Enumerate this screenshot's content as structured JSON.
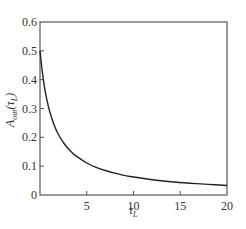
{
  "chart_data": {
    "type": "line",
    "title": "",
    "xlabel": "τ_L",
    "ylabel": "A_out(τ_L)",
    "xlim": [
      0,
      20
    ],
    "ylim": [
      0,
      0.6
    ],
    "grid": false,
    "legend": null,
    "xticks": [
      0,
      5,
      10,
      15,
      20
    ],
    "xtick_labels": [
      "",
      "5",
      "10",
      "15",
      "20"
    ],
    "yticks": [
      0,
      0.1,
      0.2,
      0.3,
      0.4,
      0.5,
      0.6
    ],
    "ytick_labels": [
      "0",
      "0.1",
      "0.2",
      "0.3",
      "0.4",
      "0.5",
      "0.6"
    ],
    "series": [
      {
        "name": "A_out",
        "color": "#222222",
        "x": [
          0,
          0.25,
          0.5,
          0.75,
          1,
          1.5,
          2,
          2.5,
          3,
          3.5,
          4,
          5,
          6,
          7,
          8,
          9,
          10,
          12,
          14,
          16,
          18,
          20
        ],
        "y": [
          0.5,
          0.426,
          0.37,
          0.328,
          0.294,
          0.244,
          0.208,
          0.182,
          0.161,
          0.145,
          0.132,
          0.111,
          0.096,
          0.085,
          0.076,
          0.068,
          0.0625,
          0.053,
          0.046,
          0.041,
          0.037,
          0.033
        ]
      }
    ]
  },
  "labels": {
    "x_main": "τ",
    "x_sub": "L",
    "y_main": "A",
    "y_sub": "out",
    "y_paren_open": "(τ",
    "y_paren_sub": "L",
    "y_paren_close": ")"
  }
}
